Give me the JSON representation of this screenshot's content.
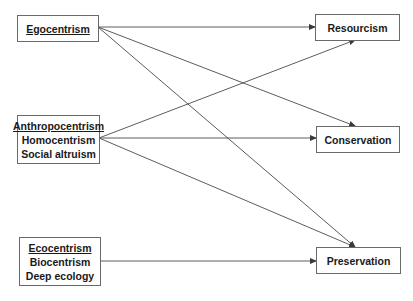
{
  "diagram": {
    "type": "flow-diagram",
    "left_nodes": [
      {
        "id": "egocentrism",
        "lines": [
          "Egocentrism"
        ],
        "underlined_first": true
      },
      {
        "id": "anthropocentrism",
        "lines": [
          "Anthropocentrism",
          "Homocentrism",
          "Social altruism"
        ],
        "underlined_first": true
      },
      {
        "id": "ecocentrism",
        "lines": [
          "Ecocentrism",
          "Biocentrism",
          "Deep ecology"
        ],
        "underlined_first": true
      }
    ],
    "right_nodes": [
      {
        "id": "resourcism",
        "label": "Resourcism"
      },
      {
        "id": "conservation",
        "label": "Conservation"
      },
      {
        "id": "preservation",
        "label": "Preservation"
      }
    ],
    "edges": [
      {
        "from": "egocentrism",
        "to": "resourcism"
      },
      {
        "from": "egocentrism",
        "to": "conservation"
      },
      {
        "from": "egocentrism",
        "to": "preservation"
      },
      {
        "from": "anthropocentrism",
        "to": "resourcism"
      },
      {
        "from": "anthropocentrism",
        "to": "conservation"
      },
      {
        "from": "anthropocentrism",
        "to": "preservation"
      },
      {
        "from": "ecocentrism",
        "to": "preservation"
      }
    ],
    "line_color": "#4a4a4a",
    "border_color": "#6a6a6a"
  }
}
